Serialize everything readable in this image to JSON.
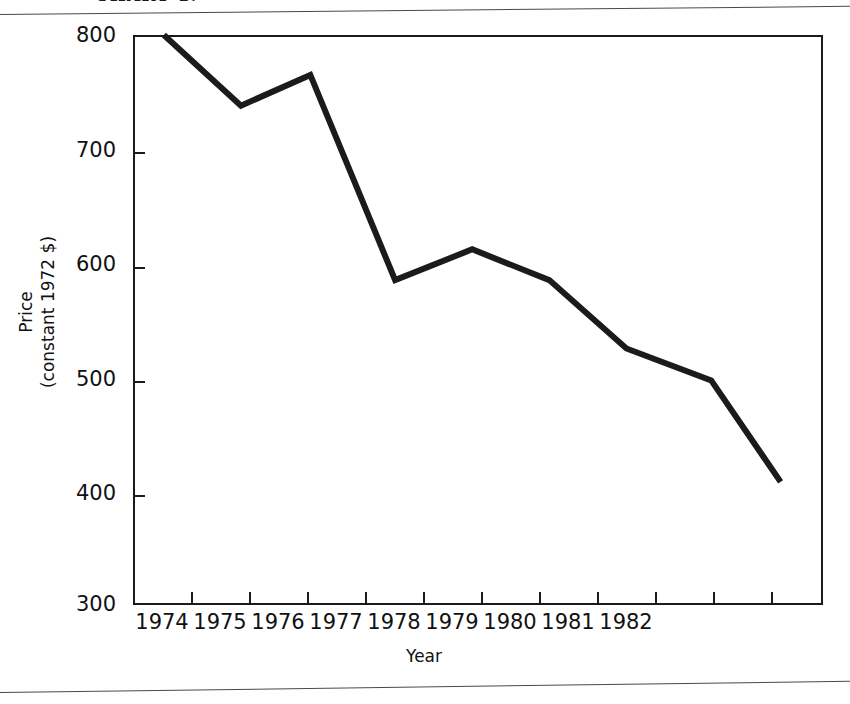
{
  "caption": {
    "text": "CHART 1."
  },
  "chart_data": {
    "type": "line",
    "title": "",
    "xlabel": "Year",
    "ylabel_lines": [
      "Price",
      "(constant 1972 $)"
    ],
    "ylabel": "Price (constant 1972 $)",
    "x": [
      1974.4,
      1975.4,
      1976.3,
      1977.4,
      1978.4,
      1979.4,
      1980.4,
      1981.5,
      1982.4
    ],
    "values": [
      800,
      738,
      765,
      585,
      612,
      585,
      525,
      497,
      408
    ],
    "series": [
      {
        "name": "Price (constant 1972 $)",
        "values": [
          800,
          738,
          765,
          585,
          612,
          585,
          525,
          497,
          408
        ]
      }
    ],
    "xtick_labels": [
      "1974",
      "1975",
      "1976",
      "1977",
      "1978",
      "1979",
      "1980",
      "1981",
      "1982"
    ],
    "xtick_values": [
      1974,
      1975,
      1976,
      1977,
      1978,
      1979,
      1980,
      1981,
      1982
    ],
    "ytick_labels": [
      "800",
      "700",
      "600",
      "500",
      "400",
      "300"
    ],
    "ytick_values": [
      800,
      700,
      600,
      500,
      400,
      300
    ],
    "xlim": [
      1974,
      1982.95
    ],
    "ylim": [
      300,
      800
    ],
    "grid": false,
    "legend": "none",
    "line_color": "#1b1b1b",
    "line_width": 6,
    "background_color": "#ffffff"
  }
}
